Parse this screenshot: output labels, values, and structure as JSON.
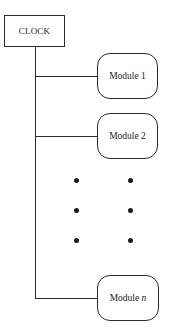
{
  "diagram": {
    "clock": {
      "label": "CLOCK"
    },
    "modules": [
      {
        "prefix": "Module",
        "index": "1",
        "index_italic": false
      },
      {
        "prefix": "Module",
        "index": "2",
        "index_italic": false
      },
      {
        "prefix": "Module",
        "index": "n",
        "index_italic": true
      }
    ],
    "ellipsis": {
      "rows": 3,
      "columns": 2,
      "symbol": "•"
    },
    "colors": {
      "stroke": "#2a2a2a",
      "background": "#ffffff",
      "text": "#222222"
    }
  }
}
